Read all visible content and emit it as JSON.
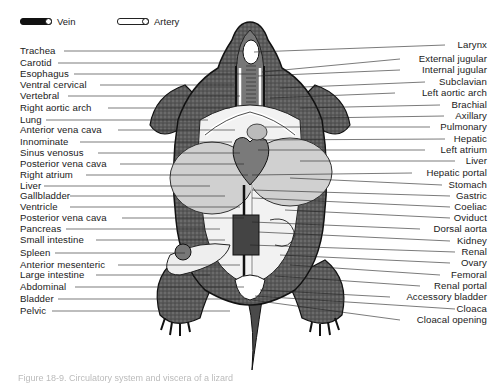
{
  "legend": {
    "vein_label": "Vein",
    "artery_label": "Artery"
  },
  "labels_left": [
    {
      "text": "Trachea",
      "y": 46
    },
    {
      "text": "Carotid",
      "y": 58
    },
    {
      "text": "Esophagus",
      "y": 69
    },
    {
      "text": "Ventral cervical",
      "y": 80
    },
    {
      "text": "Vertebral",
      "y": 91
    },
    {
      "text": "Right aortic arch",
      "y": 103
    },
    {
      "text": "Lung",
      "y": 115
    },
    {
      "text": "Anterior vena cava",
      "y": 125
    },
    {
      "text": "Innominate",
      "y": 137
    },
    {
      "text": "Sinus venosus",
      "y": 148
    },
    {
      "text": "Posterior vena cava",
      "y": 159
    },
    {
      "text": "Right atrium",
      "y": 170
    },
    {
      "text": "Liver",
      "y": 181
    },
    {
      "text": "Gallbladder",
      "y": 191
    },
    {
      "text": "Ventricle",
      "y": 202
    },
    {
      "text": "Posterior vena cava",
      "y": 213
    },
    {
      "text": "Pancreas",
      "y": 224
    },
    {
      "text": "Small intestine",
      "y": 235
    },
    {
      "text": "Spleen",
      "y": 248
    },
    {
      "text": "Anterior mesenteric",
      "y": 260
    },
    {
      "text": "Large intestine",
      "y": 270
    },
    {
      "text": "Abdominal",
      "y": 282
    },
    {
      "text": "Bladder",
      "y": 294
    },
    {
      "text": "Pelvic",
      "y": 306
    }
  ],
  "labels_right": [
    {
      "text": "Larynx",
      "y": 40
    },
    {
      "text": "External jugular",
      "y": 54
    },
    {
      "text": "Internal jugular",
      "y": 65
    },
    {
      "text": "Subclavian",
      "y": 77
    },
    {
      "text": "Left aortic arch",
      "y": 88
    },
    {
      "text": "Brachial",
      "y": 100
    },
    {
      "text": "Axillary",
      "y": 111
    },
    {
      "text": "Pulmonary",
      "y": 122
    },
    {
      "text": "Hepatic",
      "y": 134
    },
    {
      "text": "Left atrium",
      "y": 145
    },
    {
      "text": "Liver",
      "y": 156
    },
    {
      "text": "Hepatic portal",
      "y": 168
    },
    {
      "text": "Stomach",
      "y": 180
    },
    {
      "text": "Gastric",
      "y": 191
    },
    {
      "text": "Coeliac",
      "y": 202
    },
    {
      "text": "Oviduct",
      "y": 213
    },
    {
      "text": "Dorsal aorta",
      "y": 224
    },
    {
      "text": "Kidney",
      "y": 236
    },
    {
      "text": "Renal",
      "y": 247
    },
    {
      "text": "Ovary",
      "y": 258
    },
    {
      "text": "Femoral",
      "y": 270
    },
    {
      "text": "Renal portal",
      "y": 281
    },
    {
      "text": "Accessory bladder",
      "y": 292
    },
    {
      "text": "Cloaca",
      "y": 304
    },
    {
      "text": "Cloacal opening",
      "y": 315
    }
  ],
  "caption": "Figure 18-9.  Circulatory system and viscera of a lizard"
}
